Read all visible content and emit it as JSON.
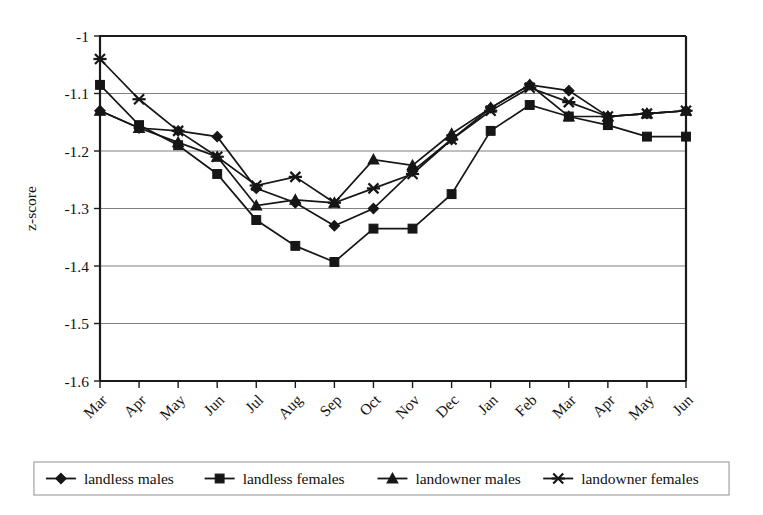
{
  "chart_data": {
    "type": "line",
    "title": "",
    "xlabel": "",
    "ylabel": "z-score",
    "ylim": [
      -1.6,
      -1.0
    ],
    "ytick_labels": [
      "-1",
      "-1.1",
      "-1.2",
      "-1.3",
      "-1.4",
      "-1.5",
      "-1.6"
    ],
    "ytick_values": [
      -1.0,
      -1.1,
      -1.2,
      -1.3,
      -1.4,
      -1.5,
      -1.6
    ],
    "grid": "horizontal",
    "legend_position": "bottom",
    "categories": [
      "Mar",
      "Apr",
      "May",
      "Jun",
      "Jul",
      "Aug",
      "Sep",
      "Oct",
      "Nov",
      "Dec",
      "Jan",
      "Feb",
      "Mar",
      "Apr",
      "May",
      "Jun"
    ],
    "series": [
      {
        "name": "landless males",
        "marker": "diamond",
        "values": [
          -1.13,
          -1.16,
          -1.165,
          -1.175,
          -1.265,
          -1.29,
          -1.33,
          -1.3,
          -1.235,
          -1.18,
          -1.125,
          -1.085,
          -1.095,
          -1.14,
          -1.135,
          -1.13
        ]
      },
      {
        "name": "landless females",
        "marker": "square",
        "values": [
          -1.085,
          -1.155,
          -1.19,
          -1.24,
          -1.32,
          -1.365,
          -1.393,
          -1.335,
          -1.335,
          -1.275,
          -1.165,
          -1.12,
          -1.14,
          -1.155,
          -1.175,
          -1.175
        ]
      },
      {
        "name": "landowner males",
        "marker": "triangle",
        "values": [
          -1.13,
          -1.16,
          -1.185,
          -1.21,
          -1.295,
          -1.285,
          -1.29,
          -1.215,
          -1.225,
          -1.17,
          -1.125,
          -1.085,
          -1.14,
          -1.14,
          -1.135,
          -1.13
        ]
      },
      {
        "name": "landowner females",
        "marker": "cross",
        "values": [
          -1.04,
          -1.11,
          -1.165,
          -1.21,
          -1.26,
          -1.245,
          -1.29,
          -1.265,
          -1.24,
          -1.18,
          -1.13,
          -1.09,
          -1.115,
          -1.14,
          -1.135,
          -1.13
        ]
      }
    ]
  },
  "legend": {
    "items": [
      {
        "label": "landless males",
        "marker": "diamond"
      },
      {
        "label": "landless females",
        "marker": "square"
      },
      {
        "label": "landowner males",
        "marker": "triangle"
      },
      {
        "label": "landowner females",
        "marker": "cross"
      }
    ]
  },
  "colors": {
    "series": "#161616",
    "grid": "#808080",
    "axis": "#1a1a1a",
    "background": "#ffffff"
  }
}
